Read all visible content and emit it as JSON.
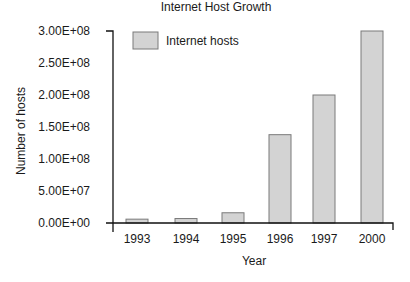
{
  "chart_data": {
    "type": "bar",
    "title": "Internet Host Growth",
    "xlabel": "Year",
    "ylabel": "Number of hosts",
    "categories": [
      "1993",
      "1994",
      "1995",
      "1996",
      "1997",
      "2000"
    ],
    "series": [
      {
        "name": "Internet hosts",
        "values": [
          6000000,
          7000000,
          16000000,
          138000000,
          200000000,
          300000000
        ]
      }
    ],
    "values": [
      6000000,
      7000000,
      16000000,
      138000000,
      200000000,
      300000000
    ],
    "ylim": [
      0,
      300000000
    ],
    "yticks": [
      0,
      50000000,
      100000000,
      150000000,
      200000000,
      250000000,
      300000000
    ],
    "ytick_labels": [
      "0.00E+00",
      "5.00E+07",
      "1.00E+08",
      "1.50E+08",
      "2.00E+08",
      "2.50E+08",
      "3.00E+08"
    ],
    "grid": false,
    "legend_position": "upper-left",
    "colors": {
      "bar_fill": "#d3d3d3",
      "bar_stroke": "#7a7a7a",
      "axis": "#111111",
      "text": "#1a1a1a"
    }
  },
  "labels": {
    "title": "Internet Host Growth",
    "xlabel": "Year",
    "ylabel": "Number of hosts",
    "legend": "Internet hosts"
  }
}
